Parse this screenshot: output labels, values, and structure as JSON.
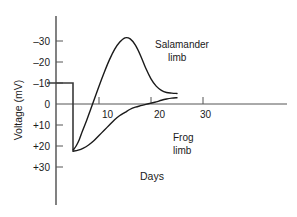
{
  "chart_data": {
    "type": "line",
    "title": "",
    "xlabel": "Days",
    "ylabel": "Voltage (mV)",
    "x_ticks": [
      10,
      20,
      30
    ],
    "x_tick_labels": [
      "10",
      "20",
      "30"
    ],
    "xlim": [
      0,
      32
    ],
    "y_ticks": [
      -30,
      -20,
      -10,
      0,
      10,
      20,
      30
    ],
    "y_tick_labels": [
      "–30",
      "–20",
      "–10",
      "0",
      "+10",
      "+20",
      "+30"
    ],
    "ylim": [
      -34,
      34
    ],
    "y_axis_inverted": true,
    "grid": false,
    "legend_position": "inline-annotation",
    "series": [
      {
        "name": "Salamander limb",
        "label": "Salamander",
        "label_line2": "limb",
        "points": [
          [
            5.0,
            22.0
          ],
          [
            5.6,
            20.0
          ],
          [
            6.2,
            17.0
          ],
          [
            6.8,
            13.0
          ],
          [
            7.6,
            8.0
          ],
          [
            8.4,
            2.5
          ],
          [
            9.2,
            -3.0
          ],
          [
            10.0,
            -8.5
          ],
          [
            11.0,
            -15.0
          ],
          [
            12.0,
            -21.0
          ],
          [
            13.0,
            -26.0
          ],
          [
            14.0,
            -29.5
          ],
          [
            15.0,
            -31.5
          ],
          [
            16.0,
            -31.0
          ],
          [
            17.0,
            -28.0
          ],
          [
            18.0,
            -23.0
          ],
          [
            19.0,
            -17.0
          ],
          [
            20.0,
            -12.0
          ],
          [
            21.0,
            -8.5
          ],
          [
            22.0,
            -6.5
          ],
          [
            23.0,
            -5.5
          ],
          [
            24.0,
            -5.2
          ],
          [
            25.0,
            -5.0
          ]
        ]
      },
      {
        "name": "Frog limb",
        "label": "Frog",
        "label_line2": "limb",
        "points": [
          [
            5.0,
            22.5
          ],
          [
            6.0,
            22.0
          ],
          [
            7.0,
            21.0
          ],
          [
            8.0,
            19.5
          ],
          [
            9.0,
            17.5
          ],
          [
            10.0,
            15.0
          ],
          [
            11.0,
            12.5
          ],
          [
            12.0,
            10.0
          ],
          [
            13.0,
            7.5
          ],
          [
            14.0,
            5.5
          ],
          [
            15.0,
            4.0
          ],
          [
            16.0,
            2.5
          ],
          [
            17.0,
            1.5
          ],
          [
            18.0,
            0.8
          ],
          [
            19.0,
            0.2
          ],
          [
            20.0,
            -0.4
          ],
          [
            21.0,
            -1.0
          ],
          [
            22.0,
            -1.8
          ],
          [
            23.0,
            -2.4
          ],
          [
            24.0,
            -2.8
          ],
          [
            25.0,
            -3.0
          ]
        ]
      }
    ],
    "step_trace": {
      "name": "stimulus step",
      "points": [
        [
          0.0,
          -10.0
        ],
        [
          5.0,
          -10.0
        ],
        [
          5.0,
          22.0
        ]
      ]
    },
    "annotations": [
      {
        "text": "Salamander",
        "x": 20.0,
        "y": -24.0
      },
      {
        "text": "limb",
        "x": 21.4,
        "y": -19.0
      },
      {
        "text": "Frog",
        "x": 22.0,
        "y": 11.0
      },
      {
        "text": "limb",
        "x": 22.0,
        "y": 15.5
      },
      {
        "text": "Days",
        "x": 18.0,
        "y": 27.5
      }
    ]
  },
  "labels": {
    "y_axis_title": "Voltage (mV)",
    "x_axis_title": "Days",
    "y_tick_minus30": "–30",
    "y_tick_minus20": "–20",
    "y_tick_minus10": "–10",
    "y_tick_zero": "0",
    "y_tick_plus10": "+10",
    "y_tick_plus20": "+20",
    "y_tick_plus30": "+30",
    "x_tick_10": "10",
    "x_tick_20": "20",
    "x_tick_30": "30",
    "salamander_line1": "Salamander",
    "salamander_line2": "limb",
    "frog_line1": "Frog",
    "frog_line2": "limb"
  },
  "colors": {
    "background": "#ffffff",
    "axis": "#1a1a1a",
    "zero_line": "#555555",
    "curve": "#1a1a1a",
    "step": "#3a3a3a",
    "text": "#1a1a1a"
  }
}
